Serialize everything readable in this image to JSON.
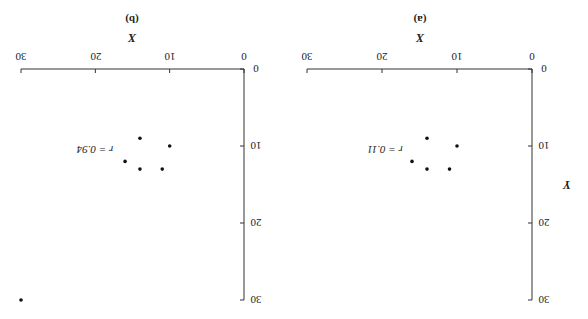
{
  "orientation": "rotated-180",
  "chart_data": [
    {
      "type": "scatter",
      "panel_label": "(a)",
      "xlabel": "X",
      "ylabel": "Y",
      "xlim": [
        0,
        30
      ],
      "ylim": [
        0,
        30
      ],
      "xticks": [
        0,
        10,
        20,
        30
      ],
      "yticks": [
        0,
        10,
        20,
        30
      ],
      "grid": false,
      "annotation": "r = 0.11",
      "points": [
        {
          "x": 14,
          "y": 9
        },
        {
          "x": 10,
          "y": 10
        },
        {
          "x": 16,
          "y": 12
        },
        {
          "x": 14,
          "y": 13
        },
        {
          "x": 11,
          "y": 13
        }
      ]
    },
    {
      "type": "scatter",
      "panel_label": "(b)",
      "xlabel": "X",
      "ylabel": "Y",
      "xlim": [
        0,
        30
      ],
      "ylim": [
        0,
        30
      ],
      "xticks": [
        0,
        10,
        20,
        30
      ],
      "yticks": [
        0,
        10,
        20,
        30
      ],
      "grid": false,
      "annotation": "r = 0.94",
      "points": [
        {
          "x": 14,
          "y": 9
        },
        {
          "x": 10,
          "y": 10
        },
        {
          "x": 16,
          "y": 12
        },
        {
          "x": 14,
          "y": 13
        },
        {
          "x": 11,
          "y": 13
        },
        {
          "x": 30,
          "y": 30
        }
      ]
    }
  ],
  "labels": {
    "a": {
      "panel": "(a)",
      "x_title": "X",
      "y_title": "Y",
      "r": "r = 0.11"
    },
    "b": {
      "panel": "(b)",
      "x_title": "X",
      "r": "r = 0.94"
    },
    "ticks": [
      "0",
      "10",
      "20",
      "30"
    ]
  }
}
